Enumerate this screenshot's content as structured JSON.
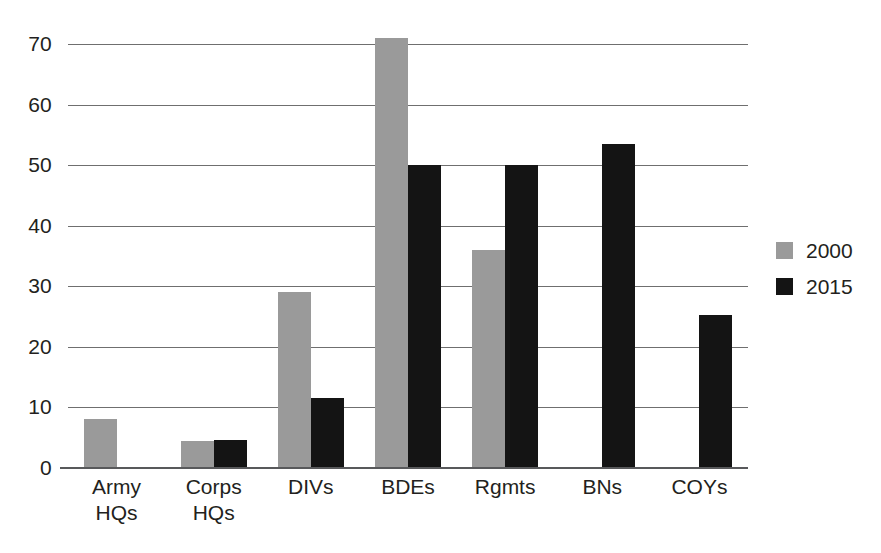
{
  "chart_data": {
    "type": "bar",
    "title": "",
    "subtitle": "",
    "xlabel": "",
    "ylabel": "",
    "grid": true,
    "legend_position": "right",
    "ylim": [
      0,
      70
    ],
    "yticks": [
      0,
      10,
      20,
      30,
      40,
      50,
      60,
      70
    ],
    "ytick_labels": [
      "0",
      "10",
      "20",
      "30",
      "40",
      "50",
      "60",
      "70"
    ],
    "categories": [
      "Army HQs",
      "Corps HQs",
      "DIVs",
      "BDEs",
      "Rgmts",
      "BNs",
      "COYs"
    ],
    "category_lines": [
      [
        "Army",
        "HQs"
      ],
      [
        "Corps",
        "HQs"
      ],
      [
        "DIVs",
        ""
      ],
      [
        "BDEs",
        ""
      ],
      [
        "Rgmts",
        ""
      ],
      [
        "BNs",
        ""
      ],
      [
        "COYs",
        ""
      ]
    ],
    "series": [
      {
        "name": "2000",
        "color": "#9a9a9a",
        "values": [
          8.1,
          4.5,
          29,
          71,
          36,
          0,
          0
        ]
      },
      {
        "name": "2015",
        "color": "#141414",
        "values": [
          0,
          4.7,
          11.5,
          50,
          50,
          53.5,
          25.3
        ]
      }
    ]
  },
  "legend": {
    "items": [
      {
        "label": "2000",
        "color": "#9a9a9a"
      },
      {
        "label": "2015",
        "color": "#141414"
      }
    ]
  },
  "colors": {
    "series_2000": "#9a9a9a",
    "series_2015": "#141414",
    "gridline": "#6f6f6f",
    "axis": "#58595b",
    "text": "#231f20",
    "background": "#ffffff"
  },
  "caption_cutoff": ""
}
